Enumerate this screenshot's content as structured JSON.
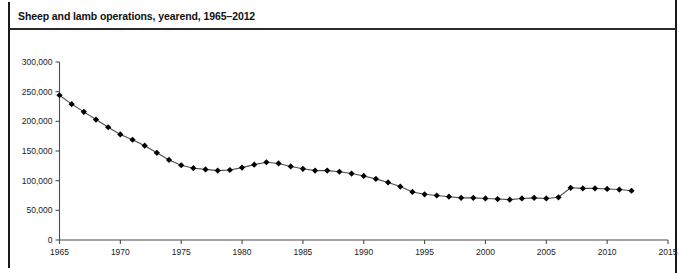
{
  "figure": {
    "title": "Sheep and lamb operations, yearend, 1965–2012",
    "caption_partial": ""
  },
  "colors": {
    "line": "#4d4d4d",
    "marker": "#000000",
    "axis": "#4d4d4d",
    "text": "#111111",
    "frame": "#1a1a1a"
  },
  "chart_data": {
    "type": "line",
    "title": "Sheep and lamb operations, yearend, 1965–2012",
    "xlabel": "",
    "ylabel": "",
    "xlim": [
      1965,
      2015
    ],
    "ylim": [
      0,
      300000
    ],
    "grid": false,
    "legend": "none",
    "xticks": [
      1965,
      1970,
      1975,
      1980,
      1985,
      1990,
      1995,
      2000,
      2005,
      2010,
      2015
    ],
    "xtick_labels": [
      "1965",
      "1970",
      "1975",
      "1980",
      "1985",
      "1990",
      "1995",
      "2000",
      "2005",
      "2010",
      "2015"
    ],
    "yticks": [
      0,
      50000,
      100000,
      150000,
      200000,
      250000,
      300000
    ],
    "ytick_labels": [
      "0",
      "50,000",
      "100,000",
      "150,000",
      "200,000",
      "250,000",
      "300,000"
    ],
    "marker": "diamond",
    "x": [
      1965,
      1966,
      1967,
      1968,
      1969,
      1970,
      1971,
      1972,
      1973,
      1974,
      1975,
      1976,
      1977,
      1978,
      1979,
      1980,
      1981,
      1982,
      1983,
      1984,
      1985,
      1986,
      1987,
      1988,
      1989,
      1990,
      1991,
      1992,
      1993,
      1994,
      1995,
      1996,
      1997,
      1998,
      1999,
      2000,
      2001,
      2002,
      2003,
      2004,
      2005,
      2006,
      2007,
      2008,
      2009,
      2010,
      2011,
      2012
    ],
    "values": [
      244000,
      229000,
      216000,
      203000,
      190000,
      178000,
      169000,
      159000,
      147000,
      135000,
      126000,
      121000,
      119000,
      117000,
      118000,
      122000,
      127000,
      131000,
      129000,
      124000,
      120000,
      117000,
      117000,
      115000,
      112000,
      108000,
      103000,
      97000,
      90000,
      81000,
      77000,
      75000,
      73000,
      71000,
      71000,
      70000,
      69000,
      68000,
      70000,
      71000,
      70000,
      72000,
      88000,
      87000,
      87000,
      86000,
      85000,
      83000
    ]
  }
}
